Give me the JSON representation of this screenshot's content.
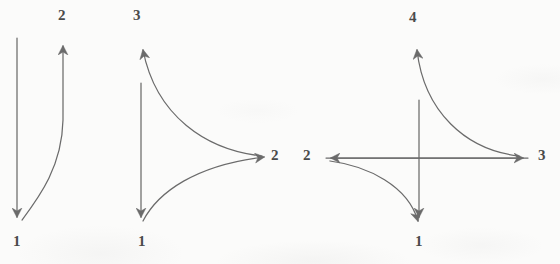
{
  "figure": {
    "background_color": "#fbfbfa",
    "stroke_color": "#6b6b6b",
    "label_color": "#4a4a4a",
    "width": 560,
    "height": 264
  },
  "diagrams": [
    {
      "id": "diagram-1",
      "name": "two-state-scheme",
      "state_count": 2,
      "labels": [
        {
          "id": "d1-label-1",
          "text": "1",
          "x": 13,
          "y": 234
        },
        {
          "id": "d1-label-2",
          "text": "2",
          "x": 58,
          "y": 8
        }
      ]
    },
    {
      "id": "diagram-2",
      "name": "three-state-scheme",
      "state_count": 3,
      "labels": [
        {
          "id": "d2-label-1",
          "text": "1",
          "x": 138,
          "y": 234
        },
        {
          "id": "d2-label-3",
          "text": "3",
          "x": 133,
          "y": 8
        },
        {
          "id": "d2-label-2",
          "text": "2",
          "x": 271,
          "y": 148
        }
      ]
    },
    {
      "id": "diagram-3",
      "name": "four-state-scheme",
      "state_count": 4,
      "labels": [
        {
          "id": "d3-label-1",
          "text": "1",
          "x": 415,
          "y": 234
        },
        {
          "id": "d3-label-4",
          "text": "4",
          "x": 409,
          "y": 10
        },
        {
          "id": "d3-label-2",
          "text": "2",
          "x": 303,
          "y": 148
        },
        {
          "id": "d3-label-3",
          "text": "3",
          "x": 538,
          "y": 148
        }
      ]
    }
  ],
  "strokes": {
    "diagram_1": [
      {
        "id": "d1-arrow-down",
        "name": "arrow-state2-to-state1",
        "d": "M 17 38 L 17 217",
        "marker": "arrowhead-end"
      },
      {
        "id": "d1-arrow-up-curved",
        "name": "curved-arrow-state1-to-state2",
        "d": "M 22 220 C 40 196 62 166 63 120 C 63 92 63 62 63 46",
        "marker": "arrowhead-end"
      }
    ],
    "diagram_2": [
      {
        "id": "d2-arrow-down",
        "name": "arrow-state3-to-state1",
        "d": "M 141 83 L 141 217",
        "marker": "arrowhead-end"
      },
      {
        "id": "d2-curve-up",
        "name": "curved-arrow-state2-to-state3",
        "d": "M 262 156 C 206 150 156 116 143 50",
        "marker": "arrowhead-end"
      },
      {
        "id": "d2-curve-low",
        "name": "curved-arrow-state1-to-state2",
        "d": "M 143 221 C 158 192 196 165 264 157",
        "marker": "arrowhead-end"
      }
    ],
    "diagram_3": [
      {
        "id": "d3-arrow-down",
        "name": "arrow-state4-to-state1",
        "d": "M 419 100 L 419 217",
        "marker": "arrowhead-end"
      },
      {
        "id": "d3-axis-left",
        "name": "arrow-state3-to-state2",
        "d": "M 528 158 L 331 158",
        "marker": "arrowhead-end"
      },
      {
        "id": "d3-axis-right",
        "name": "arrow-state2-to-state3",
        "d": "M 326 158 L 523 158",
        "marker": "arrowhead-end"
      },
      {
        "id": "d3-curve-upper-right",
        "name": "curved-arrow-state3-to-state4",
        "d": "M 519 156 C 466 150 424 112 417 50",
        "marker": "arrowhead-end"
      },
      {
        "id": "d3-curve-lower-left",
        "name": "curved-arrow-state2-to-state1",
        "d": "M 330 161 C 368 166 408 186 418 221",
        "marker": "arrowhead-end"
      }
    ]
  }
}
